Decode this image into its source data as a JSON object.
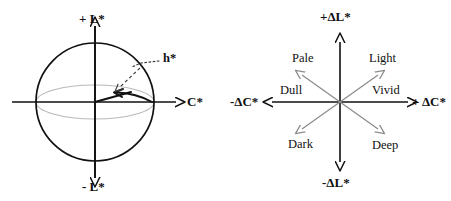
{
  "figure": {
    "title": "",
    "background_color": "#ffffff",
    "stroke_color": "#111111",
    "gray_color": "#b9b9b9",
    "diagonal_color": "#8d8d8d"
  },
  "left_diagram": {
    "name": "lightness-chroma-hue-sphere",
    "shape": "sphere-with-equatorial-ellipse",
    "axes": {
      "vertical_positive_label": "+ L*",
      "vertical_negative_label": "- L*",
      "horizontal_positive_label": "C*"
    },
    "annotation": {
      "label": "h*",
      "description": "hue-angle-arc"
    }
  },
  "right_diagram": {
    "name": "delta-lightness-delta-chroma-quadrants",
    "axes": {
      "vertical_positive_label": "+ΔL*",
      "vertical_negative_label": "-ΔL*",
      "horizontal_positive_label": "+ ΔC*",
      "horizontal_negative_label": "-ΔC*"
    },
    "quadrant_labels": [
      {
        "key": "upper_left",
        "label": "Pale"
      },
      {
        "key": "upper_right",
        "label": "Light"
      },
      {
        "key": "mid_left",
        "label": "Dull"
      },
      {
        "key": "mid_right",
        "label": "Vivid"
      },
      {
        "key": "lower_left",
        "label": "Dark"
      },
      {
        "key": "lower_right",
        "label": "Deep"
      }
    ]
  }
}
